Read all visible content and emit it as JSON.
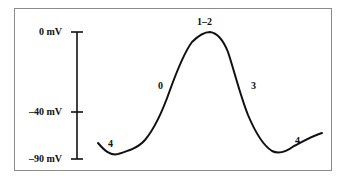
{
  "diagram": {
    "axis": {
      "labels": [
        "0 mV",
        "–40 mV",
        "–90 mV"
      ],
      "values_mV": [
        0,
        -40,
        -90
      ]
    },
    "phase_labels": {
      "phase4_left": "4",
      "phase0": "0",
      "phase12": "1–2",
      "phase3": "3",
      "phase4_right": "4"
    },
    "colors": {
      "line": "#111111",
      "frame": "#8a8a8a",
      "background": "#ffffff"
    }
  }
}
